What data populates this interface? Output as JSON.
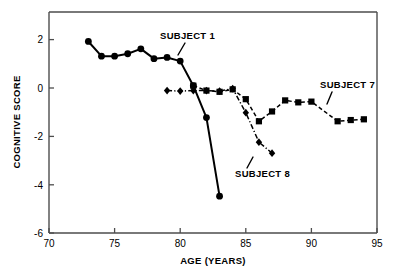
{
  "chart_data": {
    "type": "line",
    "title": "",
    "xlabel": "AGE (YEARS)",
    "ylabel": "COGNITIVE SCORE",
    "xlim": [
      70,
      95
    ],
    "ylim": [
      -6,
      3
    ],
    "xticks": [
      70,
      75,
      80,
      85,
      90,
      95
    ],
    "xtick_labels": [
      "70",
      "75",
      "80",
      "85",
      "90",
      "95"
    ],
    "yticks": [
      2,
      0,
      -2,
      -4,
      -6
    ],
    "ytick_labels": [
      "2",
      "0",
      "-2",
      "-4",
      "-6"
    ],
    "grid": false,
    "legend": "inline-annotations",
    "series": [
      {
        "name": "SUBJECT 1",
        "marker": "circle",
        "linestyle": "solid",
        "x": [
          73,
          74,
          75,
          76,
          77,
          78,
          79,
          80,
          81,
          82,
          83
        ],
        "values": [
          1.8,
          1.2,
          1.2,
          1.3,
          1.5,
          1.1,
          1.15,
          1.0,
          0.0,
          -1.3,
          -4.5
        ]
      },
      {
        "name": "SUBJECT 7",
        "marker": "square",
        "linestyle": "dashed",
        "x": [
          81,
          82,
          83,
          84,
          85,
          86,
          87,
          88,
          89,
          90,
          92,
          93,
          94
        ],
        "values": [
          0.0,
          -0.2,
          -0.25,
          -0.15,
          -0.55,
          -1.45,
          -1.05,
          -0.6,
          -0.68,
          -0.65,
          -1.45,
          -1.4,
          -1.37
        ]
      },
      {
        "name": "SUBJECT 8",
        "marker": "diamond",
        "linestyle": "dashdot",
        "x": [
          79,
          80,
          81,
          82,
          83,
          84,
          85,
          86,
          87
        ],
        "values": [
          -0.2,
          -0.22,
          -0.2,
          -0.2,
          -0.22,
          -0.12,
          -1.1,
          -2.3,
          -2.75
        ]
      }
    ],
    "annotations": [
      {
        "text": "SUBJECT 1",
        "label_x": 80.1,
        "label_y": 2.3
      },
      {
        "text": "SUBJECT 7",
        "label_x": 92.6,
        "label_y": 0.35
      },
      {
        "text": "SUBJECT 8",
        "label_x": 85.7,
        "label_y": -3.5
      }
    ]
  }
}
